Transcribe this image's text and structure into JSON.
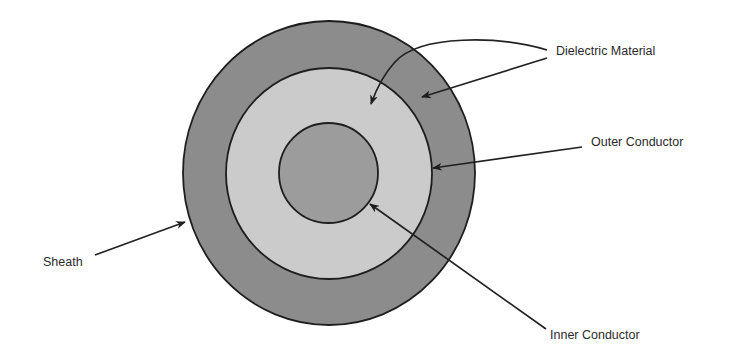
{
  "diagram": {
    "colors": {
      "sheath_fill": "#8c8c8c",
      "dielectric_fill": "#cbcbcb",
      "inner_conductor_fill": "#9c9c9c",
      "outline": "#1e1e1e",
      "background": "#ffffff"
    },
    "layers": [
      {
        "id": "sheath",
        "label": "Sheath",
        "cx": 329,
        "cy": 173,
        "rx": 146,
        "ry": 152
      },
      {
        "id": "outer-conductor",
        "label": "Outer Conductor",
        "cx": 329,
        "cy": 173.5,
        "rx": 103,
        "ry": 105.5
      },
      {
        "id": "inner-conductor",
        "label": "Inner Conductor",
        "cx": 328.5,
        "cy": 173,
        "rx": 49.5,
        "ry": 50
      }
    ],
    "labels": {
      "dielectric": "Dielectric Material",
      "outer_conductor": "Outer Conductor",
      "sheath": "Sheath",
      "inner_conductor": "Inner Conductor"
    }
  }
}
